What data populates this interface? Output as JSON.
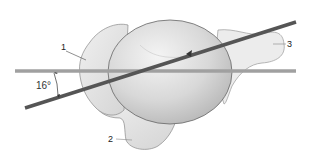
{
  "figure": {
    "type": "anatomical-illustration",
    "labels": [
      {
        "id": "1",
        "text": "1"
      },
      {
        "id": "2",
        "text": "2"
      },
      {
        "id": "3",
        "text": "3"
      }
    ],
    "angle": {
      "text": "16°",
      "value_deg": 16
    },
    "lines": {
      "reference_line_color": "#a0a0a0",
      "axis_line_color": "#555555"
    }
  }
}
